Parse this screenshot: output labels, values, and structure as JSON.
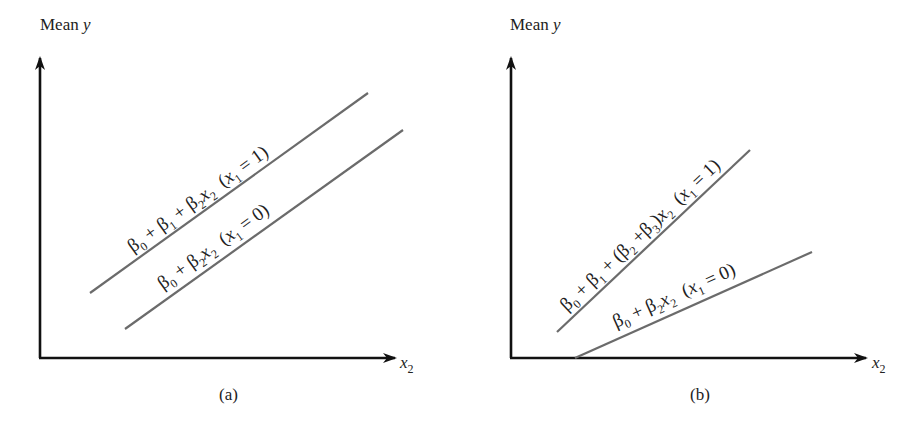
{
  "figure": {
    "panels": [
      {
        "id": "a",
        "caption": "(a)",
        "y_axis_label": {
          "main": "Mean ",
          "italic": "y"
        },
        "x_axis_label": {
          "var": "x",
          "sub": "2"
        },
        "lines": [
          {
            "case": "x1 = 1",
            "equation_text": "β0 + β1 + β2x2  (x1 = 1)",
            "parts": {
              "b0": "β",
              "b0s": "0",
              "p1": " + ",
              "b1": "β",
              "b1s": "1",
              "p2": " + ",
              "b2": "β",
              "b2s": "2",
              "x": "x",
              "xs": "2",
              "cond_open": "  (",
              "cx": "x",
              "cxs": "1",
              "cond_eq": " = 1)"
            }
          },
          {
            "case": "x1 = 0",
            "equation_text": "β0 + β2x2  (x1 = 0)",
            "parts": {
              "b0": "β",
              "b0s": "0",
              "p1": " + ",
              "b2": "β",
              "b2s": "2",
              "x": "x",
              "xs": "2",
              "cond_open": "  (",
              "cx": "x",
              "cxs": "1",
              "cond_eq": " = 0)"
            }
          }
        ]
      },
      {
        "id": "b",
        "caption": "(b)",
        "y_axis_label": {
          "main": "Mean ",
          "italic": "y"
        },
        "x_axis_label": {
          "var": "x",
          "sub": "2"
        },
        "lines": [
          {
            "case": "x1 = 1",
            "equation_text": "β0 + β1 + (β2 + β3)x2  (x1 = 1)",
            "parts": {
              "b0": "β",
              "b0s": "0",
              "p1": " + ",
              "b1": "β",
              "b1s": "1",
              "p2": " + (",
              "b2": "β",
              "b2s": "2",
              "p3": " +",
              "b3": "β",
              "b3s": "3",
              "p4": ")",
              "x": "x",
              "xs": "2",
              "cond_open": "  (",
              "cx": "x",
              "cxs": "1",
              "cond_eq": " = 1)"
            }
          },
          {
            "case": "x1 = 0",
            "equation_text": "β0 + β2x2  (x1 = 0)",
            "parts": {
              "b0": "β",
              "b0s": "0",
              "p1": " + ",
              "b2": "β",
              "b2s": "2",
              "x": "x",
              "xs": "2",
              "cond_open": "  (",
              "cx": "x",
              "cxs": "1",
              "cond_eq": " = 0)"
            }
          }
        ]
      }
    ],
    "colors": {
      "axis": "#111111",
      "lines": "#6b6b6b",
      "text": "#222222"
    }
  }
}
